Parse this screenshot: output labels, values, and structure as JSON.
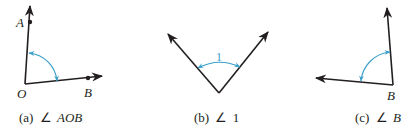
{
  "colors": {
    "ray": "#231f20",
    "arc": "#3a9fc9",
    "background": "#ffffff"
  },
  "figures": [
    {
      "id": "a",
      "caption_prefix": "(a)",
      "angle_symbol": "∠",
      "caption_name": "AOB",
      "points": {
        "A": "A",
        "O": "O",
        "B": "B"
      }
    },
    {
      "id": "b",
      "caption_prefix": "(b)",
      "angle_symbol": "∠",
      "caption_name": "1",
      "arc_label": "1"
    },
    {
      "id": "c",
      "caption_prefix": "(c)",
      "angle_symbol": "∠",
      "caption_name": "B",
      "points": {
        "B": "B"
      }
    }
  ]
}
